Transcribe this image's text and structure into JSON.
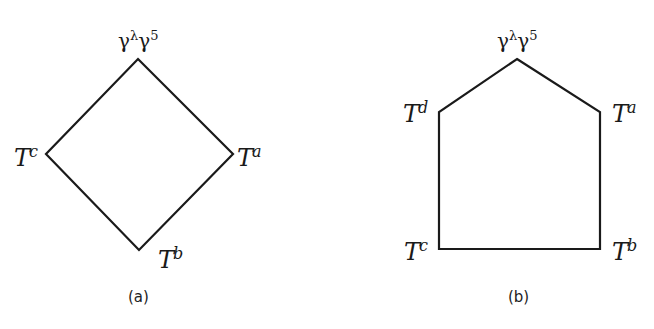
{
  "diagrams": {
    "a": {
      "caption": "(a)",
      "shape": "diamond",
      "vertices": {
        "top": {
          "base": "γ",
          "sup": "λ",
          "base2": "γ",
          "sup2": "5",
          "x": 138,
          "y": 59
        },
        "left": {
          "base": "T",
          "sup": "c",
          "x": 46,
          "y": 154
        },
        "right": {
          "base": "T",
          "sup": "a",
          "x": 233,
          "y": 154
        },
        "bottom": {
          "base": "T",
          "sup": "b",
          "x": 139,
          "y": 250
        }
      }
    },
    "b": {
      "caption": "(b)",
      "shape": "pentagon",
      "vertices": {
        "top": {
          "base": "γ",
          "sup": "λ",
          "base2": "γ",
          "sup2": "5",
          "x": 517,
          "y": 59
        },
        "upper_left": {
          "base": "T",
          "sup": "d",
          "x": 439,
          "y": 112
        },
        "upper_right": {
          "base": "T",
          "sup": "a",
          "x": 600,
          "y": 112
        },
        "lower_left": {
          "base": "T",
          "sup": "c",
          "x": 439,
          "y": 249
        },
        "lower_right": {
          "base": "T",
          "sup": "b",
          "x": 600,
          "y": 249
        }
      }
    }
  },
  "colors": {
    "stroke": "#1a1a1a",
    "background": "#ffffff"
  }
}
